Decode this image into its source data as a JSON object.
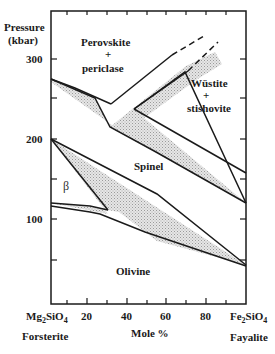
{
  "diagram": {
    "y_axis": {
      "label_line1": "Pressure",
      "label_line2": "(kbar)",
      "ticks": [
        "300",
        "200",
        "100"
      ]
    },
    "x_axis": {
      "label": "Mole %",
      "ticks": [
        "20",
        "40",
        "60",
        "80"
      ],
      "left_end": {
        "formula_base": "Mg",
        "sub1": "2",
        "mid": "SiO",
        "sub2": "4",
        "name": "Forsterite"
      },
      "right_end": {
        "formula_base": "Fe",
        "sub1": "2",
        "mid": "SiO",
        "sub2": "4",
        "name": "Fayalite"
      }
    },
    "fields": {
      "perovskite_line1": "Perovskite",
      "perovskite_plus": "+",
      "perovskite_line2": "periclase",
      "wustite_line1": "Wüstite",
      "wustite_plus": "+",
      "wustite_line2": "stishovite",
      "spinel": "Spinel",
      "beta": "β",
      "olivine": "Olivine"
    },
    "colors": {
      "line": "#1a1a1a",
      "two_phase_fill": "#d8d8d8"
    }
  }
}
